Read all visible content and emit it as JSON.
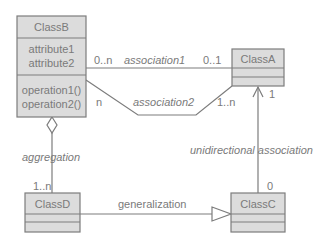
{
  "classes": {
    "classB": {
      "name": "ClassB",
      "attributes": [
        "attribute1",
        "attribute2"
      ],
      "operations": [
        "operation1()",
        "operation2()"
      ]
    },
    "classA": {
      "name": "ClassA"
    },
    "classC": {
      "name": "ClassC"
    },
    "classD": {
      "name": "ClassD"
    }
  },
  "relations": {
    "association1": {
      "label": "association1",
      "mult_source": "0..n",
      "mult_target": "0..1"
    },
    "association2": {
      "label": "association2",
      "mult_source": "n",
      "mult_target": "1..n"
    },
    "aggregation": {
      "label": "aggregation",
      "mult_target": "1..n"
    },
    "unidirectional": {
      "label": "unidirectional association",
      "mult_source": "0",
      "mult_target": "1"
    },
    "generalization": {
      "label": "generalization"
    }
  }
}
